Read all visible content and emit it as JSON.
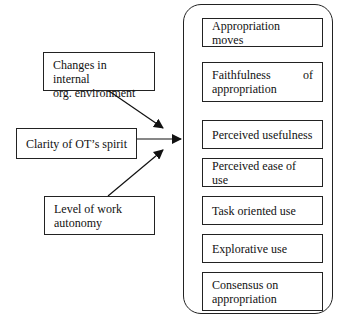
{
  "diagram": {
    "antecedents": [
      {
        "id": "changes",
        "label_line1": "Changes in internal",
        "label_line2": "org. environment"
      },
      {
        "id": "clarity",
        "label": "Clarity of OT’s spirit"
      },
      {
        "id": "autonomy",
        "label_line1": "Level of work",
        "label_line2": "autonomy"
      }
    ],
    "outcomes": [
      {
        "label": "Appropriation moves"
      },
      {
        "label_a": "Faithfulness",
        "label_b": "of",
        "label_line2": "appropriation"
      },
      {
        "label": "Perceived usefulness"
      },
      {
        "label": "Perceived ease of use"
      },
      {
        "label": "Task oriented use"
      },
      {
        "label": "Explorative use"
      },
      {
        "label_line1": "Consensus on",
        "label_line2": "appropriation"
      }
    ],
    "edges": [
      {
        "from": "changes",
        "to": "outcomes-group"
      },
      {
        "from": "clarity",
        "to": "outcomes-group"
      },
      {
        "from": "autonomy",
        "to": "outcomes-group"
      }
    ],
    "colors": {
      "stroke": "#222222",
      "background": "#ffffff"
    }
  }
}
